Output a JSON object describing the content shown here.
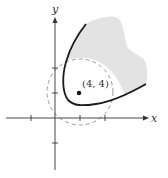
{
  "figure": {
    "x_axis_label": "x",
    "y_axis_label": "y",
    "point_label": "(4, 4)",
    "point": {
      "x": 4,
      "y": 4
    },
    "x_ticks": [
      -4,
      4,
      8
    ],
    "y_ticks": [
      -4,
      4,
      8
    ],
    "colors": {
      "axis": "#333333",
      "curve": "#1a1a1a",
      "shade": "#e3e3e3",
      "dashed_circle": "#9a9a9a"
    }
  }
}
